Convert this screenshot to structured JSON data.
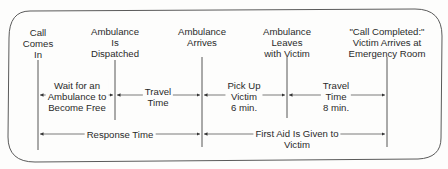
{
  "diagram": {
    "type": "timeline",
    "frame": {
      "stroke": "#555555",
      "background": "#fdfdfc",
      "corner": "rounded"
    },
    "events": [
      {
        "id": "call-comes-in",
        "label": "Call\nComes\nIn",
        "x": 38
      },
      {
        "id": "ambulance-dispatched",
        "label": "Ambulance\nIs\nDispatched",
        "x": 115
      },
      {
        "id": "ambulance-arrives",
        "label": "Ambulance\nArrives",
        "x": 202
      },
      {
        "id": "ambulance-leaves",
        "label": "Ambulance\nLeaves\nwith Victim",
        "x": 287
      },
      {
        "id": "call-completed",
        "label": "\"Call Completed:\"\nVictim Arrives at\nEmergency Room",
        "x": 387
      }
    ],
    "intervals": [
      {
        "id": "wait",
        "label": "Wait for an\nAmbulance to\nBecome Free",
        "from": 0,
        "to": 1
      },
      {
        "id": "travel-1",
        "label": "Travel\nTime",
        "from": 1,
        "to": 2
      },
      {
        "id": "pickup",
        "label": "Pick Up\nVictim\n6 min.",
        "from": 2,
        "to": 3
      },
      {
        "id": "travel-2",
        "label": "Travel\nTime\n8 min.",
        "from": 3,
        "to": 4
      }
    ],
    "spans": [
      {
        "id": "response-time",
        "label": "Response Time",
        "from": 0,
        "to": 2
      },
      {
        "id": "first-aid",
        "label": "First Aid Is Given to\nVictim",
        "from": 2,
        "to": 4
      }
    ]
  }
}
